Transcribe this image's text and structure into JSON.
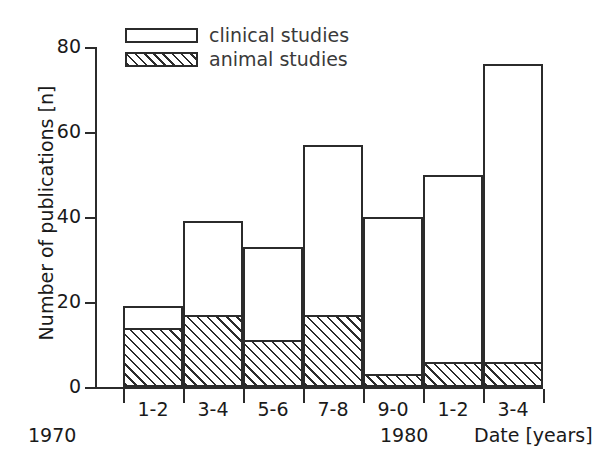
{
  "chart_data": {
    "type": "bar",
    "subtype": "stacked",
    "title": "",
    "xlabel": "Date [years]",
    "ylabel": "Number of publications [n]",
    "ylim": [
      0,
      80
    ],
    "yticks": [
      0,
      20,
      40,
      60,
      80
    ],
    "grid": false,
    "legend_position": "top-left",
    "categories": [
      "1-2",
      "3-4",
      "5-6",
      "7-8",
      "9-0",
      "1-2",
      "3-4"
    ],
    "decade_markers": [
      {
        "label": "1970",
        "at_category_index": 0
      },
      {
        "label": "1980",
        "at_category_index": 5
      }
    ],
    "series": [
      {
        "name": "animal studies",
        "style": "hatched",
        "values": [
          14,
          17,
          11,
          17,
          3,
          6,
          6
        ]
      },
      {
        "name": "clinical studies",
        "style": "open",
        "values": [
          5,
          22,
          22,
          40,
          37,
          44,
          70
        ],
        "cumulative_totals": [
          19,
          39,
          33,
          57,
          40,
          50,
          76
        ]
      }
    ]
  },
  "axes": {
    "y_tick_labels": [
      "80",
      "60",
      "40",
      "20",
      "0"
    ],
    "y_title": "Number of publications [n]",
    "x_tick_labels": [
      "1-2",
      "3-4",
      "5-6",
      "7-8",
      "9-0",
      "1-2",
      "3-4"
    ],
    "x_title": "Date [years]",
    "decade_left": "1970",
    "decade_right": "1980"
  },
  "legend": {
    "items": [
      {
        "label": "clinical studies",
        "swatch": "open-box"
      },
      {
        "label": "animal studies",
        "swatch": "hatched-box"
      }
    ]
  },
  "colors": {
    "ink": "#2b2b2b",
    "background": "#ffffff",
    "text": "#1a1a1a"
  }
}
